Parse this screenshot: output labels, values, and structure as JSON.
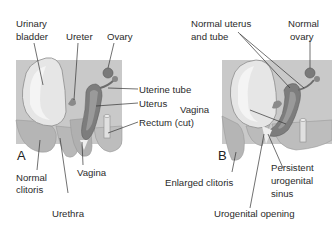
{
  "figure": {
    "panels": [
      {
        "id": "A",
        "letter": "A",
        "labels": {
          "urinary_bladder_1": "Urinary",
          "urinary_bladder_2": "bladder",
          "ureter": "Ureter",
          "ovary": "Ovary",
          "uterine_tube": "Uterine tube",
          "uterus": "Uterus",
          "rectum": "Rectum (cut)",
          "normal_clitoris_1": "Normal",
          "normal_clitoris_2": "clitoris",
          "vagina": "Vagina",
          "urethra": "Urethra"
        }
      },
      {
        "id": "B",
        "letter": "B",
        "labels": {
          "normal_uterus_1": "Normal uterus",
          "normal_uterus_2": "and tube",
          "normal_ovary_1": "Normal",
          "normal_ovary_2": "ovary",
          "vagina": "Vagina",
          "enlarged_clitoris": "Enlarged clitoris",
          "persistent_sinus_1": "Persistent",
          "persistent_sinus_2": "urogenital",
          "persistent_sinus_3": "sinus",
          "urogenital_opening": "Urogenital opening"
        }
      }
    ],
    "colors": {
      "background_tissue": "#c9c9c9",
      "body_tissue": "#b5b5b5",
      "bladder_fill": "#e6e6e6",
      "bladder_highlight": "#f4f4f4",
      "uterus_dark": "#7d7d7d",
      "uterus_mid": "#9a9a9a",
      "rectum_fill": "#e0e0e0",
      "leader_line": "#333333",
      "text": "#2b2b2b"
    }
  }
}
